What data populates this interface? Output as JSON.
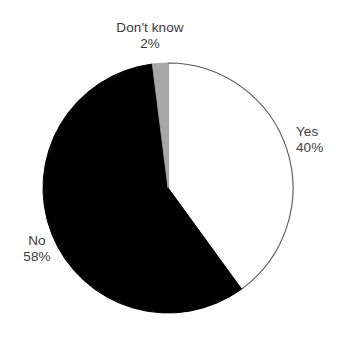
{
  "chart_data": {
    "type": "pie",
    "title": "",
    "subtitle": "",
    "xlabel": "",
    "ylabel": "",
    "legend_position": "none",
    "grid": false,
    "labels_inline": true,
    "start_angle_deg": 0,
    "direction": "clockwise",
    "categories": [
      "Yes",
      "No",
      "Don't know"
    ],
    "values": [
      40,
      58,
      2
    ],
    "units": "%",
    "slices": [
      {
        "label": "Yes",
        "value": 40,
        "value_text": "40%",
        "color": "#ffffff",
        "stroke": "#555555",
        "start_deg": 0,
        "end_deg": 144
      },
      {
        "label": "No",
        "value": 58,
        "value_text": "58%",
        "color": "#000000",
        "stroke": "#000000",
        "start_deg": 144,
        "end_deg": 352.8
      },
      {
        "label": "Don't know",
        "value": 2,
        "value_text": "2%",
        "color": "#a8a8a8",
        "stroke": "#a8a8a8",
        "start_deg": 352.8,
        "end_deg": 360
      }
    ]
  },
  "labels": {
    "dontknow": {
      "name": "Don't know",
      "value": "2%"
    },
    "yes": {
      "name": "Yes",
      "value": "40%"
    },
    "no": {
      "name": "No",
      "value": "58%"
    }
  },
  "colors": {
    "background": "#ffffff",
    "text": "#3a3a3a",
    "slice_yes": "#ffffff",
    "slice_no": "#000000",
    "slice_dontknow": "#a8a8a8",
    "outline": "#555555"
  }
}
